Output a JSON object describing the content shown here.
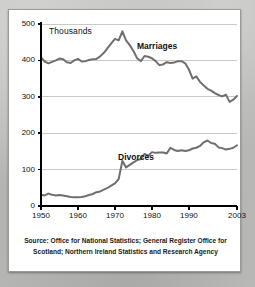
{
  "card": {
    "unit_label": "Thousands",
    "source_text": "Source: Office for National Statistics; General Register Office for Scotland; Northern Ireland Statistics and Research Agency"
  },
  "labels": {
    "marriages": "Marriages",
    "divorces": "Divorces"
  },
  "colors": {
    "line": "#6f6f6f",
    "axis": "#000000",
    "gridline": "#c9c9c9",
    "card_background": "#ffffff",
    "page_background": "#b9b9b7"
  },
  "chart_data": {
    "type": "line",
    "title": "",
    "subtitle": "",
    "xlabel": "",
    "ylabel": "Thousands",
    "xlim": [
      1950,
      2003
    ],
    "ylim": [
      0,
      500
    ],
    "grid": true,
    "legend": "inline-annotations",
    "yticks": [
      0,
      100,
      200,
      300,
      400,
      500
    ],
    "xticks": [
      1950,
      1960,
      1970,
      1980,
      1990,
      2003
    ],
    "x": [
      1950,
      1951,
      1952,
      1953,
      1954,
      1955,
      1956,
      1957,
      1958,
      1959,
      1960,
      1961,
      1962,
      1963,
      1964,
      1965,
      1966,
      1967,
      1968,
      1969,
      1970,
      1971,
      1972,
      1973,
      1974,
      1975,
      1976,
      1977,
      1978,
      1979,
      1980,
      1981,
      1982,
      1983,
      1984,
      1985,
      1986,
      1987,
      1988,
      1989,
      1990,
      1991,
      1992,
      1993,
      1994,
      1995,
      1996,
      1997,
      1998,
      1999,
      2000,
      2001,
      2002,
      2003
    ],
    "series": [
      {
        "name": "Marriages",
        "values": [
          408,
          397,
          392,
          396,
          400,
          405,
          403,
          395,
          393,
          400,
          404,
          397,
          398,
          401,
          403,
          404,
          411,
          421,
          434,
          447,
          459,
          455,
          480,
          455,
          442,
          426,
          406,
          398,
          412,
          410,
          406,
          398,
          387,
          389,
          395,
          393,
          394,
          398,
          398,
          392,
          375,
          350,
          356,
          341,
          331,
          322,
          317,
          310,
          305,
          301,
          306,
          286,
          292,
          302
        ]
      },
      {
        "name": "Divorces",
        "values": [
          31,
          29,
          34,
          31,
          29,
          30,
          29,
          27,
          25,
          24,
          24,
          25,
          27,
          30,
          33,
          38,
          40,
          45,
          50,
          56,
          62,
          74,
          124,
          106,
          113,
          120,
          126,
          129,
          143,
          138,
          148,
          146,
          147,
          147,
          144,
          160,
          154,
          151,
          153,
          151,
          153,
          158,
          160,
          165,
          175,
          180,
          173,
          171,
          161,
          159,
          155,
          157,
          160,
          167
        ]
      }
    ],
    "annotations": [
      {
        "text": "Marriages",
        "near_x": 1982,
        "near_y": 440
      },
      {
        "text": "Divorces",
        "near_x": 1977,
        "near_y": 205
      }
    ]
  }
}
